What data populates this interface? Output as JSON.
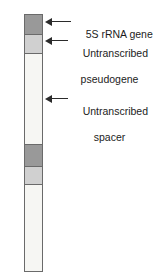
{
  "figure": {
    "type": "diagram",
    "colors": {
      "gene_segment": "#999999",
      "pseudogene_segment": "#d0d0d0",
      "spacer_segment": "#f6f6f3",
      "outline": "#6a6a6a",
      "leader_line": "#2b2b2b",
      "text": "#1c1c1c",
      "background": "#ffffff"
    },
    "bar": {
      "name": "repeat-unit-bar",
      "segments": [
        {
          "id": "gene-1",
          "kind": "5s-rrna-gene",
          "fill": "#999999",
          "top_px": 0,
          "height_px": 19
        },
        {
          "id": "pseudogene-1",
          "kind": "untranscribed-pseudogene",
          "fill": "#d0d0d0",
          "top_px": 19,
          "height_px": 19
        },
        {
          "id": "spacer-1",
          "kind": "untranscribed-spacer",
          "fill": "#f6f6f3",
          "top_px": 38,
          "height_px": 91
        },
        {
          "id": "gene-2",
          "kind": "5s-rrna-gene",
          "fill": "#999999",
          "top_px": 129,
          "height_px": 22
        },
        {
          "id": "pseudogene-2",
          "kind": "untranscribed-pseudogene",
          "fill": "#d0d0d0",
          "top_px": 151,
          "height_px": 18
        },
        {
          "id": "spacer-2",
          "kind": "untranscribed-spacer",
          "fill": "#f6f6f3",
          "top_px": 169,
          "height_px": 89
        }
      ]
    },
    "callouts": [
      {
        "id": "callout-gene",
        "target_segment": "gene-1",
        "line1": "5S rRNA gene",
        "line2": ""
      },
      {
        "id": "callout-pseudogene",
        "target_segment": "pseudogene-1",
        "line1": "Untranscribed",
        "line2": "pseudogene"
      },
      {
        "id": "callout-spacer",
        "target_segment": "spacer-1",
        "line1": "Untranscribed",
        "line2": "spacer"
      }
    ]
  }
}
